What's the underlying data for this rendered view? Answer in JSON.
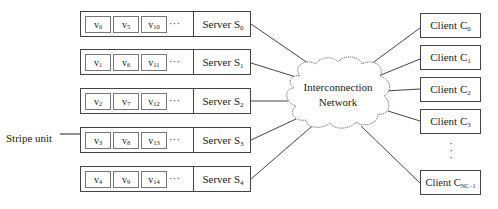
{
  "diagram": {
    "servers": [
      {
        "label": "Server S",
        "sub": "0",
        "units": [
          {
            "v": "v",
            "sub": "0"
          },
          {
            "v": "v",
            "sub": "5"
          },
          {
            "v": "v",
            "sub": "10"
          }
        ]
      },
      {
        "label": "Server S",
        "sub": "1",
        "units": [
          {
            "v": "v",
            "sub": "1"
          },
          {
            "v": "v",
            "sub": "6"
          },
          {
            "v": "v",
            "sub": "11"
          }
        ]
      },
      {
        "label": "Server S",
        "sub": "2",
        "units": [
          {
            "v": "v",
            "sub": "2"
          },
          {
            "v": "v",
            "sub": "7"
          },
          {
            "v": "v",
            "sub": "12"
          }
        ]
      },
      {
        "label": "Server S",
        "sub": "3",
        "units": [
          {
            "v": "v",
            "sub": "3"
          },
          {
            "v": "v",
            "sub": "8"
          },
          {
            "v": "v",
            "sub": "13"
          }
        ]
      },
      {
        "label": "Server S",
        "sub": "4",
        "units": [
          {
            "v": "v",
            "sub": "4"
          },
          {
            "v": "v",
            "sub": "9"
          },
          {
            "v": "v",
            "sub": "14"
          }
        ]
      }
    ],
    "ellipsis": "···",
    "network": {
      "line1": "Interconnection",
      "line2": "Network"
    },
    "clients": [
      {
        "label": "Client C",
        "sub": "0"
      },
      {
        "label": "Client C",
        "sub": "1"
      },
      {
        "label": "Client C",
        "sub": "2"
      },
      {
        "label": "Client C",
        "sub": "3"
      },
      {
        "label": "Client C",
        "sub": "NC−1"
      }
    ],
    "client_ellipsis": "⋮",
    "annotation": {
      "label": "Stripe unit"
    },
    "colors": {
      "line": "#444444",
      "cell_border": "#777777",
      "text": "#222222",
      "background": "#ffffff"
    }
  }
}
